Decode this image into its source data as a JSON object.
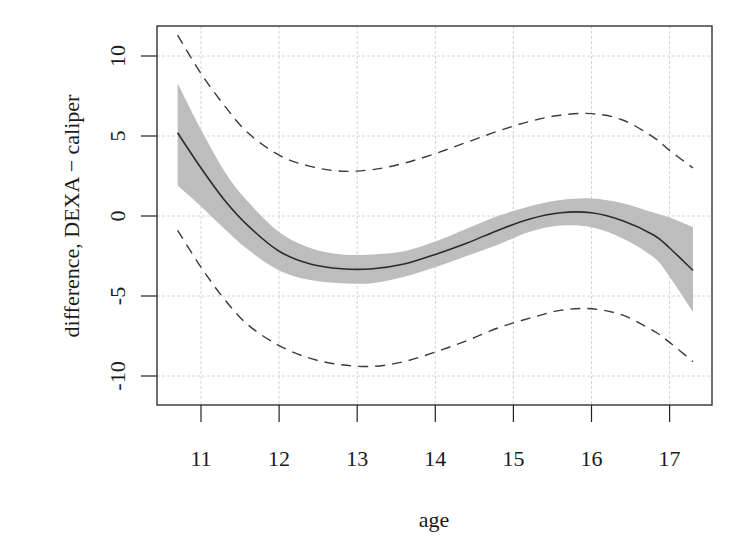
{
  "chart_data": {
    "type": "line",
    "title": "",
    "xlabel": "age",
    "ylabel": "difference, DEXA − caliper",
    "xlim": [
      10.47,
      17.57
    ],
    "ylim": [
      -12.5,
      11.9
    ],
    "grid": true,
    "legend": null,
    "x_ticks": [
      11,
      12,
      13,
      14,
      15,
      16,
      17
    ],
    "x_tick_labels": [
      "11",
      "12",
      "13",
      "14",
      "15",
      "16",
      "17"
    ],
    "y_ticks": [
      -10,
      -5,
      0,
      5,
      10
    ],
    "y_tick_labels": [
      "-10",
      "-5",
      "0",
      "5",
      "10"
    ],
    "x": [
      10.7,
      11.0,
      11.3,
      11.6,
      12.0,
      12.4,
      12.8,
      13.2,
      13.6,
      14.0,
      14.4,
      14.8,
      15.2,
      15.6,
      16.0,
      16.4,
      16.8,
      17.0,
      17.3
    ],
    "series": [
      {
        "name": "fit",
        "style": "solid",
        "values": [
          5.2,
          3.0,
          1.0,
          -0.6,
          -2.2,
          -3.0,
          -3.3,
          -3.3,
          -3.0,
          -2.4,
          -1.7,
          -0.9,
          -0.2,
          0.2,
          0.2,
          -0.3,
          -1.2,
          -2.0,
          -3.4
        ]
      },
      {
        "name": "confidence band upper",
        "style": "gray-fill",
        "values": [
          8.3,
          5.4,
          2.8,
          0.9,
          -1.0,
          -2.0,
          -2.4,
          -2.4,
          -2.2,
          -1.6,
          -0.8,
          0.0,
          0.6,
          1.0,
          1.1,
          0.8,
          0.2,
          -0.1,
          -0.7
        ]
      },
      {
        "name": "confidence band lower",
        "style": "gray-fill",
        "values": [
          1.9,
          0.6,
          -0.8,
          -2.1,
          -3.4,
          -4.0,
          -4.2,
          -4.2,
          -3.8,
          -3.2,
          -2.5,
          -1.8,
          -1.0,
          -0.6,
          -0.7,
          -1.4,
          -2.6,
          -3.8,
          -6.0
        ]
      },
      {
        "name": "prediction upper",
        "style": "dashed",
        "values": [
          11.3,
          8.9,
          6.9,
          5.2,
          3.8,
          3.1,
          2.8,
          2.9,
          3.3,
          3.9,
          4.6,
          5.3,
          5.9,
          6.3,
          6.4,
          6.0,
          4.9,
          4.1,
          3.0
        ]
      },
      {
        "name": "prediction lower",
        "style": "dashed",
        "values": [
          -0.9,
          -3.2,
          -5.2,
          -6.8,
          -8.1,
          -8.9,
          -9.3,
          -9.4,
          -9.1,
          -8.5,
          -7.8,
          -7.0,
          -6.4,
          -5.9,
          -5.8,
          -6.2,
          -7.2,
          -7.9,
          -9.1
        ]
      }
    ]
  },
  "plot": {
    "box": {
      "left": 157,
      "top": 26,
      "right": 712,
      "bottom": 405
    },
    "x_px": {
      "origin_value": 11,
      "origin_px": 201,
      "px_per_unit": 78.1
    },
    "y_px": {
      "origin_value": 0,
      "origin_px": 216,
      "px_per_unit": 16
    },
    "colors": {
      "band": "#bdbdbd",
      "fit": "#2b2b2b",
      "dashed": "#3a3a3a",
      "grid": "#d4d4d4",
      "axis": "#222222"
    }
  }
}
